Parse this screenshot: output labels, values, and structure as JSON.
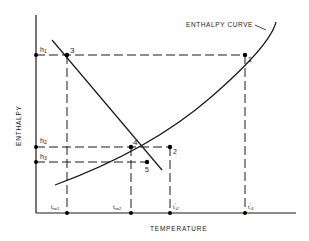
{
  "diagram": {
    "type": "enthalpy-temperature diagram",
    "axes": {
      "x_label": "TEMPERATURE",
      "y_label": "ENTHALPY"
    },
    "curve_label": "ENTHALPY CURVE",
    "y_ticks": [
      {
        "id": "h1",
        "label": "h",
        "sub": "1"
      },
      {
        "id": "h2",
        "label": "h",
        "sub": "2"
      },
      {
        "id": "h3",
        "label": "h",
        "sub": "3"
      }
    ],
    "x_ticks": [
      {
        "id": "trw1",
        "label": "t",
        "sub": "rw1"
      },
      {
        "id": "trw2",
        "label": "t",
        "sub": "rw2"
      },
      {
        "id": "ti2",
        "label": "t",
        "sub": "i2",
        "prime": "'"
      },
      {
        "id": "ti1",
        "label": "t",
        "sub": "i1",
        "prime": "'"
      }
    ],
    "points": [
      {
        "id": "1",
        "label": "1"
      },
      {
        "id": "2",
        "label": "2"
      },
      {
        "id": "3",
        "label": "3"
      },
      {
        "id": "4",
        "label": "4"
      },
      {
        "id": "5",
        "label": "5"
      }
    ],
    "line_color": "#1a1a1a"
  }
}
